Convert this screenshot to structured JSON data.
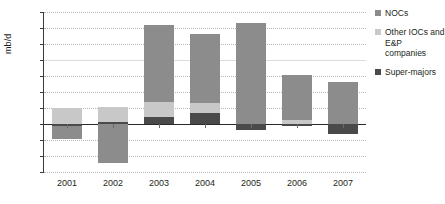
{
  "chart_data": {
    "type": "bar",
    "subtype": "stacked-bar-diverging",
    "title": "",
    "xlabel": "",
    "ylabel": "mb/d",
    "ylim": [
      -1.5,
      3.5
    ],
    "ytick_step": 0.5,
    "ytick_labels": [
      "3.5",
      "3.0",
      "2.5",
      "2.0",
      "1.5",
      "1.0",
      "0.5",
      "0",
      "-0.5",
      "-1.0",
      "-1.5"
    ],
    "ytick_values": [
      3.5,
      3.0,
      2.5,
      2.0,
      1.5,
      1.0,
      0.5,
      0,
      -0.5,
      -1.0,
      -1.5
    ],
    "categories": [
      "2001",
      "2002",
      "2003",
      "2004",
      "2005",
      "2006",
      "2007"
    ],
    "grid": "horizontal-dotted",
    "legend_position": "right",
    "series": [
      {
        "name": "NOCs",
        "color": "#8c8c8c",
        "values": [
          -0.4,
          -1.22,
          2.38,
          2.15,
          3.15,
          1.4,
          1.3
        ]
      },
      {
        "name": "Other IOCs and E&P companies",
        "color": "#c8c8c8",
        "values": [
          0.5,
          0.45,
          0.48,
          0.32,
          0.0,
          0.12,
          0.0
        ]
      },
      {
        "name": "Super-majors",
        "color": "#4a4a4a",
        "values": [
          -0.06,
          0.07,
          0.22,
          0.33,
          -0.2,
          -0.05,
          -0.3
        ]
      }
    ],
    "bar_totals_positive": [
      0.5,
      0.52,
      3.08,
      2.8,
      3.15,
      1.52,
      1.3
    ],
    "bar_totals_negative": [
      -0.46,
      -1.22,
      0.0,
      0.0,
      -0.2,
      -0.05,
      -0.3
    ]
  },
  "legend": {
    "items": [
      {
        "label": "NOCs",
        "color": "#8c8c8c"
      },
      {
        "label": "Other IOCs and E&P companies",
        "color": "#c8c8c8"
      },
      {
        "label": "Super-majors",
        "color": "#4a4a4a"
      }
    ]
  },
  "colors": {
    "nocs": "#8c8c8c",
    "other_iocs": "#c8c8c8",
    "super_majors": "#4a4a4a",
    "gridline": "#b9b9b9",
    "axis": "#3a3a3a",
    "text": "#231f20",
    "background": "#ffffff"
  }
}
